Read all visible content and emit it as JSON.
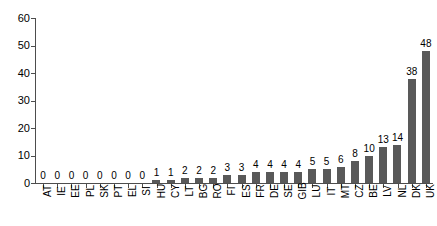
{
  "chart_data": {
    "type": "bar",
    "title": "",
    "subtitle": "",
    "xlabel": "",
    "ylabel": "",
    "ylim": [
      0,
      60
    ],
    "ytick_values": [
      60,
      50,
      40,
      30,
      20,
      10,
      0
    ],
    "ytick_labels": [
      "60",
      "50",
      "40",
      "30",
      "20",
      "10",
      "0"
    ],
    "grid": false,
    "legend": null,
    "bar_color": "#595959",
    "axis_color": "#4d4d4d",
    "value_labels_shown": true,
    "categories": [
      "AT",
      "IE",
      "EE",
      "PL",
      "SK",
      "PT",
      "EL",
      "SI",
      "HU",
      "CY",
      "LT",
      "BG",
      "RO",
      "FI",
      "ES",
      "FR",
      "DE",
      "SE",
      "GIB",
      "LU",
      "IT",
      "MT",
      "CZ",
      "BE",
      "LV",
      "NL",
      "DK",
      "UK"
    ],
    "values": [
      0,
      0,
      0,
      0,
      0,
      0,
      0,
      0,
      1,
      1,
      2,
      2,
      2,
      3,
      3,
      4,
      4,
      4,
      4,
      5,
      5,
      6,
      8,
      10,
      13,
      14,
      38,
      48
    ],
    "value_labels": [
      "0",
      "0",
      "0",
      "0",
      "0",
      "0",
      "0",
      "0",
      "1",
      "1",
      "2",
      "2",
      "2",
      "3",
      "3",
      "4",
      "4",
      "4",
      "4",
      "5",
      "5",
      "6",
      "8",
      "10",
      "13",
      "14",
      "38",
      "48"
    ]
  }
}
